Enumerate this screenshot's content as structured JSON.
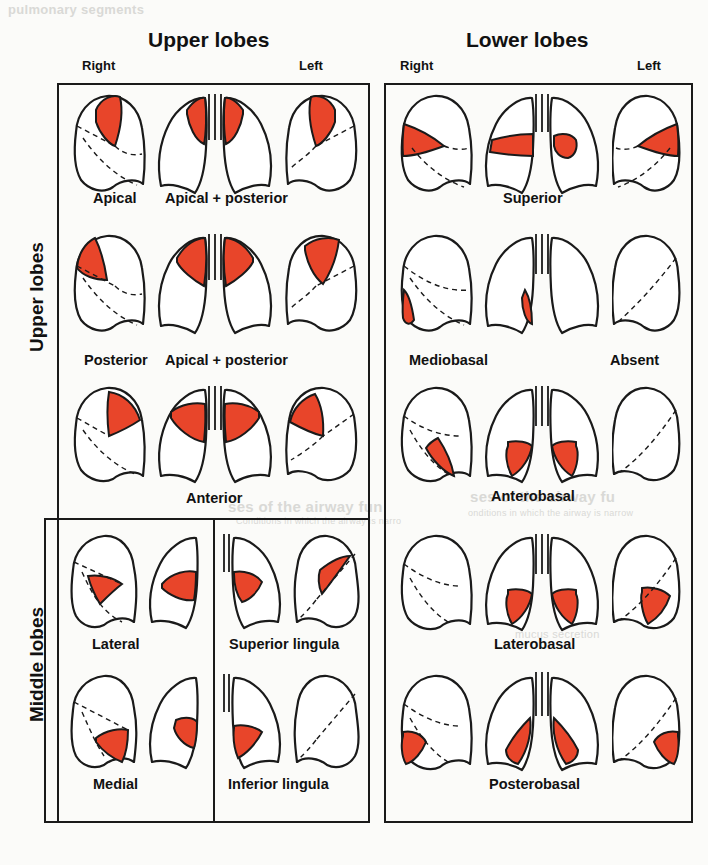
{
  "figure": {
    "type": "anatomical-diagram",
    "accent_red": "#e8452a",
    "outline_color": "#1a1a1a",
    "background": "#fbfbf9"
  },
  "headers": {
    "group_left": "Upper lobes",
    "group_right": "Lower lobes",
    "left_side_right": "Right",
    "left_side_left": "Left",
    "right_side_right": "Right",
    "right_side_left": "Left"
  },
  "row_group_labels": {
    "upper": "Upper lobes",
    "middle": "Middle lobes"
  },
  "left_panel": {
    "rows": [
      {
        "captions": [
          {
            "text": "Apical"
          },
          {
            "text": "Apical + posterior"
          }
        ]
      },
      {
        "captions": [
          {
            "text": "Posterior"
          },
          {
            "text": "Apical + posterior"
          }
        ]
      },
      {
        "captions": [
          {
            "text": "Anterior"
          }
        ]
      },
      {
        "captions": [
          {
            "text": "Lateral"
          },
          {
            "text": "Superior lingula"
          }
        ]
      },
      {
        "captions": [
          {
            "text": "Medial"
          },
          {
            "text": "Inferior lingula"
          }
        ]
      }
    ]
  },
  "right_panel": {
    "rows": [
      {
        "captions": [
          {
            "text": "Superior"
          }
        ]
      },
      {
        "captions": [
          {
            "text": "Mediobasal"
          },
          {
            "text": "Absent"
          }
        ]
      },
      {
        "captions": [
          {
            "text": "Anterobasal"
          }
        ]
      },
      {
        "captions": [
          {
            "text": "Laterobasal"
          }
        ]
      },
      {
        "captions": [
          {
            "text": "Posterobasal"
          }
        ]
      }
    ]
  },
  "ghost_text": {
    "g1": "ses of the airway fun",
    "g2": "Conditions in which the airway is narro",
    "g3": "ses of the airway fu",
    "g4": "onditions in which the airway is narrow",
    "g5": "mucus secretion",
    "g6": "pulmonary segments"
  }
}
